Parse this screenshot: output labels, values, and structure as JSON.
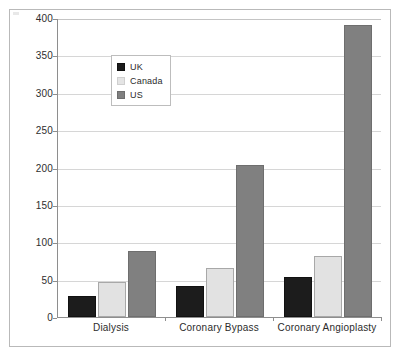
{
  "figure": {
    "frame_border_color": "#b9b9b9",
    "background": "#ffffff"
  },
  "chart_data": {
    "type": "bar",
    "title": "",
    "subtitle": "",
    "xlabel": "",
    "ylabel": "",
    "categories": [
      "Dialysis",
      "Coronary Bypass",
      "Coronary Angioplasty"
    ],
    "series": [
      {
        "name": "UK",
        "color": "#1c1c1c",
        "values": [
          28,
          42,
          54
        ]
      },
      {
        "name": "Canada",
        "color": "#e2e2e2",
        "values": [
          47,
          66,
          82
        ]
      },
      {
        "name": "US",
        "color": "#808080",
        "values": [
          88,
          204,
          390
        ]
      }
    ],
    "ylim": [
      0,
      400
    ],
    "ytick_values": [
      0,
      50,
      100,
      150,
      200,
      250,
      300,
      350,
      400
    ],
    "ytick_labels": [
      "0",
      "50",
      "100",
      "150",
      "200",
      "250",
      "300",
      "350",
      "400"
    ],
    "grid": true,
    "grid_axis": "y",
    "legend_position": "upper-left-inside",
    "annotations": []
  },
  "legend": {
    "entries": [
      {
        "label": "UK",
        "swatch": "legend-swatch-uk"
      },
      {
        "label": "Canada",
        "swatch": "legend-swatch-canada"
      },
      {
        "label": "US",
        "swatch": "legend-swatch-us"
      }
    ]
  }
}
